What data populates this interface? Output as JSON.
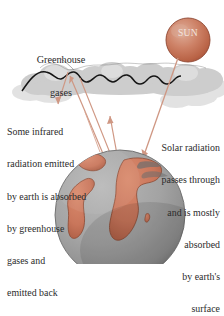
{
  "figure": {
    "name": "greenhouse-effect-diagram",
    "background": "#ffffff"
  },
  "sun": {
    "label": "SUN",
    "label_color": "#f2e4df",
    "core_color": "#d9a28f",
    "mid_color": "#c9765a",
    "edge_color": "#a6513a",
    "cx": 188,
    "cy": 40,
    "r": 22
  },
  "earth": {
    "ocean_color": "#a2a2a2",
    "ocean_shadow": "#7e7e7e",
    "land_color": "#cc7a5e",
    "land_edge_color": "#8d4a33",
    "outline_color": "#6a6a6a",
    "cx": 120,
    "cy": 215,
    "r": 65
  },
  "cloud": {
    "fill_color": "#cfcfcf",
    "fill_color_light": "#dcdcdc",
    "outline_color": "#1a1a1a"
  },
  "rays": {
    "color": "#d79a86",
    "dark_color": "#b2654c"
  },
  "labels": {
    "greenhouse": {
      "line1": "Greenhouse",
      "line2": "gases"
    },
    "infrared": [
      "Some infrared",
      "radiation emitted",
      "by earth is absorbed",
      "by greenhouse",
      "gases and",
      "emitted back"
    ],
    "solar": [
      "Solar radiation",
      "passes through",
      "and is mostly",
      "absorbed",
      "by earth's",
      "surface"
    ]
  }
}
